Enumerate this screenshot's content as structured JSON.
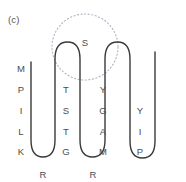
{
  "figure": {
    "panel_label": "(c)",
    "background_color": "#ffffff",
    "chain_color": "#3a3a3a",
    "residue_color": "#4d4d4d",
    "highlight_color": "#b9b0c4"
  },
  "highlight": {
    "shape": "dotted-circle",
    "cx": 85,
    "cy": 47,
    "r": 33
  },
  "chain": {
    "path": "M 31 62 L 31 140 Q 31 157 43 157 Q 55 157 55 140 L 55 59 Q 55 42 67.5 42 Q 80 42 80 59 L 80 140 Q 80 157 92.5 157 Q 105 157 105 140 L 105 59 Q 105 42 117.5 42 Q 130 42 130 59 L 130 141 Q 130 158 142.5 158 Q 155 158 155 141 L 155 52",
    "stroke_width": 1.4
  },
  "residues": [
    {
      "letter": "M",
      "x": 21,
      "y": 64
    },
    {
      "letter": "P",
      "x": 21,
      "y": 85
    },
    {
      "letter": "I",
      "x": 21,
      "y": 106
    },
    {
      "letter": "L",
      "x": 21,
      "y": 127
    },
    {
      "letter": "K",
      "x": 21,
      "y": 147
    },
    {
      "letter": "R",
      "x": 43,
      "y": 170
    },
    {
      "letter": "G",
      "x": 66,
      "y": 147
    },
    {
      "letter": "T",
      "x": 66,
      "y": 127
    },
    {
      "letter": "S",
      "x": 66,
      "y": 106
    },
    {
      "letter": "T",
      "x": 66,
      "y": 85
    },
    {
      "letter": "S",
      "x": 85,
      "y": 38
    },
    {
      "letter": "Y",
      "x": 103,
      "y": 85
    },
    {
      "letter": "G",
      "x": 103,
      "y": 106
    },
    {
      "letter": "A",
      "x": 103,
      "y": 127
    },
    {
      "letter": "M",
      "x": 103,
      "y": 147
    },
    {
      "letter": "R",
      "x": 93,
      "y": 170
    },
    {
      "letter": "Y",
      "x": 140,
      "y": 106
    },
    {
      "letter": "I",
      "x": 140,
      "y": 127
    },
    {
      "letter": "P",
      "x": 140,
      "y": 147
    }
  ],
  "sequence": "MPILKRGTSTSYGAMRYIP"
}
